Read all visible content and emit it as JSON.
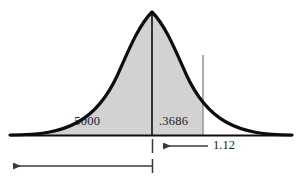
{
  "figure": {
    "labels": {
      "left_area": ".5000",
      "right_area": ".3686",
      "z_value": "1.12"
    },
    "colors": {
      "shading": "#d2d2d2",
      "curve": "#0d0d0d",
      "axis": "#0d0d0d",
      "annotation": "#4a4a4a",
      "text": "#1a1a1a"
    }
  },
  "chart_data": {
    "type": "area",
    "title": "",
    "subtitle": "",
    "xlabel": "",
    "ylabel": "",
    "distribution": "standard normal",
    "mean": 0,
    "std_dev": 1,
    "baseline_y": 135,
    "peak": {
      "x_px": 152,
      "y_px": 12
    },
    "axis_extent_px": {
      "x_start": 10,
      "x_end": 292,
      "y": 135
    },
    "shaded_regions": [
      {
        "name": "left-half-area",
        "label": ".5000",
        "value": 0.5,
        "from_z": "-infinity",
        "to_z": 0,
        "x_start_px": 15,
        "x_end_px": 152,
        "fill": "#d2d2d2"
      },
      {
        "name": "mean-to-z-area",
        "label": ".3686",
        "value": 0.3686,
        "from_z": 0,
        "to_z": 1.12,
        "x_start_px": 152,
        "x_end_px": 203,
        "fill": "#d2d2d2"
      }
    ],
    "total_shaded_area": 0.8686,
    "markers": [
      {
        "name": "mean-line",
        "label": "",
        "z": 0,
        "x_px": 152,
        "from_y_px": 12,
        "to_y_px": 135
      },
      {
        "name": "z-boundary-line",
        "label": "1.12",
        "z": 1.12,
        "x_px": 203,
        "from_y_px": 55,
        "to_y_px": 135
      }
    ],
    "annotations": [
      {
        "name": "z-measure-arrow",
        "text": "1.12",
        "direction": "left",
        "tick_x_px": 152,
        "line_from_px": 157,
        "line_to_px": 208,
        "y_px": 146
      },
      {
        "name": "cumulative-area-arrow",
        "text": "",
        "direction": "left",
        "tick_x_px": 152,
        "line_from_px": 12,
        "line_to_px": 152,
        "y_px": 166
      }
    ],
    "grid": false,
    "legend": null
  }
}
